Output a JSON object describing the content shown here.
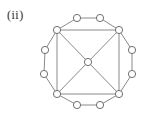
{
  "figure": {
    "label": "(ii)",
    "type": "graph-diagram",
    "colors": {
      "background": "#ffffff",
      "edge": "#8a8a8a",
      "node_stroke": "#6f6f6f",
      "node_fill": "#ffffff",
      "label": "#2b2b2b"
    },
    "node_radius": 3.6,
    "edge_width": 1,
    "node_stroke_width": 1,
    "nodes": [
      {
        "id": "center",
        "x": 88,
        "y": 62
      },
      {
        "id": "tl",
        "x": 57,
        "y": 30
      },
      {
        "id": "tr",
        "x": 119,
        "y": 30
      },
      {
        "id": "br",
        "x": 119,
        "y": 94
      },
      {
        "id": "bl",
        "x": 57,
        "y": 94
      },
      {
        "id": "top1",
        "x": 77,
        "y": 18
      },
      {
        "id": "top2",
        "x": 100,
        "y": 18
      },
      {
        "id": "right1",
        "x": 132,
        "y": 50
      },
      {
        "id": "right2",
        "x": 132,
        "y": 74
      },
      {
        "id": "bottom1",
        "x": 77,
        "y": 105
      },
      {
        "id": "bottom2",
        "x": 100,
        "y": 105
      },
      {
        "id": "left1",
        "x": 45,
        "y": 50
      },
      {
        "id": "left2",
        "x": 44,
        "y": 74
      }
    ],
    "edges": [
      [
        "tl",
        "top1"
      ],
      [
        "top1",
        "top2"
      ],
      [
        "top2",
        "tr"
      ],
      [
        "tr",
        "right1"
      ],
      [
        "right1",
        "right2"
      ],
      [
        "right2",
        "br"
      ],
      [
        "br",
        "bottom2"
      ],
      [
        "bottom2",
        "bottom1"
      ],
      [
        "bottom1",
        "bl"
      ],
      [
        "bl",
        "left2"
      ],
      [
        "left2",
        "left1"
      ],
      [
        "left1",
        "tl"
      ],
      [
        "tl",
        "tr"
      ],
      [
        "tr",
        "br"
      ],
      [
        "br",
        "bl"
      ],
      [
        "bl",
        "tl"
      ],
      [
        "tl",
        "center"
      ],
      [
        "tr",
        "center"
      ],
      [
        "br",
        "center"
      ],
      [
        "bl",
        "center"
      ]
    ]
  }
}
